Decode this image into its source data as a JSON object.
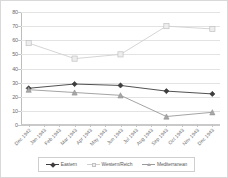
{
  "chart_data": {
    "type": "line",
    "title": "",
    "xlabel": "",
    "ylabel": "",
    "ylim": [
      0,
      80
    ],
    "ytick_values": [
      80,
      70,
      60,
      50,
      40,
      30,
      20,
      10,
      0
    ],
    "ytick_labels": [
      "80",
      "70",
      "60",
      "50",
      "40",
      "30",
      "20",
      "10",
      "0"
    ],
    "grid": true,
    "legend_position": "bottom",
    "categories": [
      "Dec 1942",
      "Jan 1943",
      "Feb 1943",
      "Mar 1943",
      "Apr 1943",
      "May 1943",
      "Jun 1943",
      "Jul 1943",
      "Aug 1943",
      "Sep 1943",
      "Oct 1943",
      "Nov 1943",
      "Dec 1943"
    ],
    "series": [
      {
        "name": "Eastern",
        "color": "#3d3d3d",
        "marker": "diamond",
        "x": [
          "Dec 1942",
          "Mar 1943",
          "Jun 1943",
          "Sep 1943",
          "Dec 1943"
        ],
        "values": [
          26,
          29,
          28,
          24,
          22
        ]
      },
      {
        "name": "Western/Reich",
        "color": "#d0d0d0",
        "marker": "square",
        "x": [
          "Dec 1942",
          "Mar 1943",
          "Jun 1943",
          "Sep 1943",
          "Dec 1943"
        ],
        "values": [
          58,
          47,
          50,
          70,
          68
        ]
      },
      {
        "name": "Mediterranean",
        "color": "#9a9a9a",
        "marker": "triangle",
        "x": [
          "Dec 1942",
          "Mar 1943",
          "Jun 1943",
          "Sep 1943",
          "Dec 1943"
        ],
        "values": [
          25,
          23,
          21,
          6,
          9
        ]
      }
    ]
  },
  "legend": {
    "items": [
      {
        "label": "Eastern"
      },
      {
        "label": "Western/Reich"
      },
      {
        "label": "Mediterranean"
      }
    ]
  }
}
